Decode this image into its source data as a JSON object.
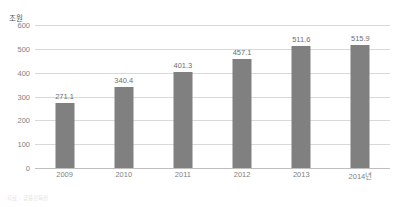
{
  "chart_data": {
    "type": "bar",
    "title": "",
    "xlabel": "",
    "ylabel": "조원",
    "unit_label": "조원",
    "categories": [
      "2009",
      "2010",
      "2011",
      "2012",
      "2013",
      "2014년"
    ],
    "values": [
      271.1,
      340.4,
      401.3,
      457.1,
      511.6,
      515.9
    ],
    "value_labels": [
      "271.1",
      "340.4",
      "401.3",
      "457.1",
      "511.6",
      "515.9"
    ],
    "ylim": [
      0,
      600
    ],
    "yticks": [
      600,
      500,
      400,
      300,
      200,
      100,
      0
    ],
    "ytick_labels": [
      "600",
      "500",
      "400",
      "300",
      "200",
      "100",
      "0"
    ],
    "grid": true,
    "legend": "none",
    "series": [
      {
        "name": "",
        "values": [
          271.1,
          340.4,
          401.3,
          457.1,
          511.6,
          515.9
        ]
      }
    ],
    "colors": {
      "bar": "#808080",
      "gridline": "#d9d9d9",
      "baseline": "#bfbfbf",
      "tick_text": "#7f7f7f",
      "value_text": "#6f6f6f",
      "unit_text": "#595959",
      "background": "#ffffff"
    }
  },
  "caption": {
    "text": "자료 : 금융감독원"
  }
}
